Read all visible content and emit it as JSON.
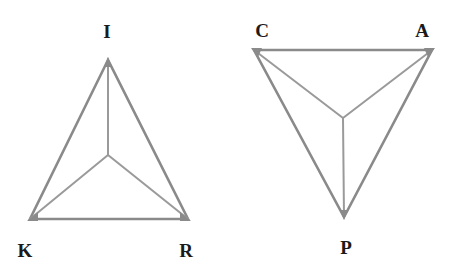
{
  "diagrams": [
    {
      "name": "IKR triangle",
      "orientation": "apex-up",
      "vertices": [
        {
          "label": "I",
          "x": 108,
          "y": 60,
          "label_x": 107,
          "label_y": 38
        },
        {
          "label": "K",
          "x": 30,
          "y": 219,
          "label_x": 25,
          "label_y": 257
        },
        {
          "label": "R",
          "x": 188,
          "y": 219,
          "label_x": 186,
          "label_y": 257
        }
      ],
      "center": {
        "x": 108,
        "y": 155
      }
    },
    {
      "name": "CAP triangle",
      "orientation": "apex-down",
      "vertices": [
        {
          "label": "C",
          "x": 254,
          "y": 50,
          "label_x": 262,
          "label_y": 37
        },
        {
          "label": "A",
          "x": 432,
          "y": 50,
          "label_x": 422,
          "label_y": 37
        },
        {
          "label": "P",
          "x": 344,
          "y": 217,
          "label_x": 346,
          "label_y": 254
        }
      ],
      "center": {
        "x": 343,
        "y": 118
      }
    }
  ],
  "colors": {
    "edge": "#8a8a8a",
    "spoke": "#9a9a9a",
    "label": "#1a1a1a",
    "background": "#ffffff"
  }
}
